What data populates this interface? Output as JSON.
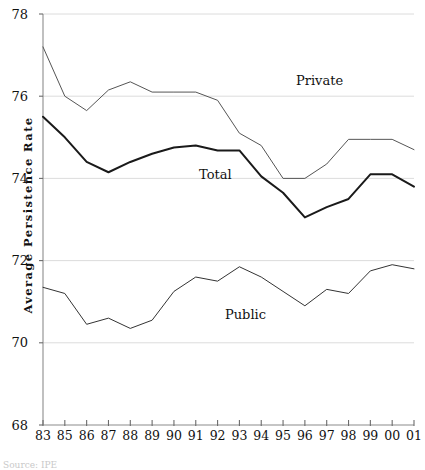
{
  "chart_data": {
    "type": "line",
    "title": "",
    "subtitle": "",
    "xlabel": "",
    "ylabel": "Average Persistence Rate",
    "ylim": [
      68,
      78
    ],
    "ytick_values": [
      68,
      70,
      72,
      74,
      76,
      78
    ],
    "ytick_labels": [
      "68",
      "70",
      "72",
      "74",
      "76",
      "78"
    ],
    "grid": "horizontal-light",
    "legend_position": "inline-annotations",
    "categories": [
      "83",
      "85",
      "86",
      "87",
      "88",
      "89",
      "90",
      "91",
      "92",
      "93",
      "94",
      "95",
      "96",
      "97",
      "98",
      "99",
      "00",
      "01"
    ],
    "x_tick_labels": [
      "83",
      "85",
      "86",
      "87",
      "88",
      "89",
      "90",
      "91",
      "92",
      "93",
      "94",
      "95",
      "96",
      "97",
      "98",
      "99",
      "00",
      "01"
    ],
    "series": [
      {
        "name": "Private",
        "label_text": "Private",
        "color": "#555555",
        "line_width": 1.0,
        "values": [
          77.2,
          76.0,
          75.65,
          76.15,
          76.35,
          76.1,
          76.1,
          76.1,
          75.9,
          75.1,
          74.8,
          74.0,
          74.0,
          74.35,
          74.95,
          74.95,
          74.95,
          74.7
        ]
      },
      {
        "name": "Total",
        "label_text": "Total",
        "color": "#1a1a1a",
        "line_width": 2.0,
        "values": [
          75.5,
          75.0,
          74.4,
          74.15,
          74.4,
          74.6,
          74.75,
          74.8,
          74.68,
          74.68,
          74.05,
          73.65,
          73.05,
          73.3,
          73.5,
          74.1,
          74.1,
          73.8
        ]
      },
      {
        "name": "Public",
        "label_text": "Public",
        "color": "#333333",
        "line_width": 1.0,
        "values": [
          71.35,
          71.2,
          70.45,
          70.6,
          70.35,
          70.55,
          71.25,
          71.6,
          71.5,
          71.85,
          71.6,
          71.25,
          70.9,
          71.3,
          71.2,
          71.75,
          71.9,
          71.8
        ]
      }
    ],
    "annotations": [
      {
        "text": "Private",
        "x_px": 296,
        "y_px": 74
      },
      {
        "text": "Total",
        "x_px": 199,
        "y_px": 168
      },
      {
        "text": "Public",
        "x_px": 225,
        "y_px": 308
      }
    ]
  },
  "footer": {
    "source_text": "Source: IPE"
  }
}
